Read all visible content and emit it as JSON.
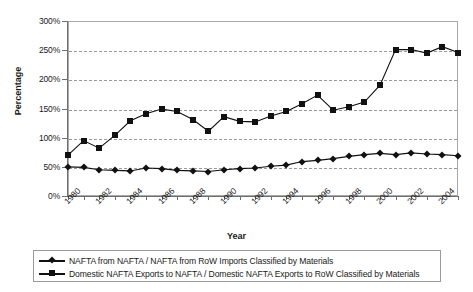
{
  "chart_data": {
    "type": "line",
    "title": "",
    "xlabel": "Year",
    "ylabel": "Percentage",
    "ylim": [
      0,
      300
    ],
    "yticks": [
      0,
      50,
      100,
      150,
      200,
      250,
      300
    ],
    "ytick_labels": [
      "0%",
      "50%",
      "100%",
      "150%",
      "200%",
      "250%",
      "300%"
    ],
    "grid": true,
    "legend_position": "bottom",
    "x": [
      1980,
      1981,
      1982,
      1983,
      1984,
      1985,
      1986,
      1987,
      1988,
      1989,
      1990,
      1991,
      1992,
      1993,
      1994,
      1995,
      1996,
      1997,
      1998,
      1999,
      2000,
      2001,
      2002,
      2003,
      2004,
      2005
    ],
    "xtick_labels": [
      "1980",
      "1982",
      "1984",
      "1986",
      "1988",
      "1990",
      "1992",
      "1994",
      "1996",
      "1998",
      "2000",
      "2002",
      "2004"
    ],
    "xtick_step": 2,
    "series": [
      {
        "name": "NAFTA from NAFTA / NAFTA from RoW Imports Classified by Materials",
        "marker": "diamond",
        "values": [
          50,
          49,
          45,
          44,
          43,
          48,
          47,
          44,
          43,
          42,
          45,
          47,
          48,
          51,
          53,
          59,
          61,
          64,
          68,
          71,
          73,
          71,
          74,
          72,
          71,
          69
        ]
      },
      {
        "name": "Domestic NAFTA Exports to NAFTA / Domestic NAFTA Exports to RoW Classified by Materials",
        "marker": "square",
        "values": [
          70,
          95,
          82,
          104,
          129,
          141,
          149,
          145,
          131,
          111,
          136,
          128,
          127,
          137,
          145,
          158,
          173,
          147,
          153,
          161,
          190,
          251,
          251,
          245,
          256,
          246
        ]
      }
    ]
  },
  "legend": {
    "items": [
      {
        "marker": "diamond",
        "label": "NAFTA from NAFTA / NAFTA from RoW Imports Classified by Materials"
      },
      {
        "marker": "square",
        "label": "Domestic NAFTA Exports to NAFTA / Domestic NAFTA Exports to RoW Classified by Materials"
      }
    ]
  }
}
